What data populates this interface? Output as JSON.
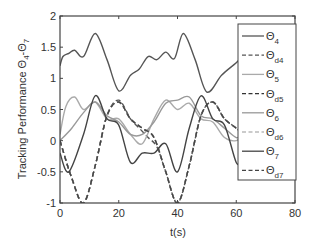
{
  "chart_data": {
    "type": "line",
    "title": "",
    "xlabel": "t(s)",
    "ylabel": "Tracking Performance Θ4-Θ7",
    "xlim": [
      0,
      80
    ],
    "ylim": [
      -1,
      2
    ],
    "xticks": [
      0,
      20,
      40,
      60,
      80
    ],
    "yticks": [
      -1,
      -0.5,
      0,
      0.5,
      1,
      1.5,
      2
    ],
    "xtick_labels": [
      "0",
      "20",
      "40",
      "60",
      "80"
    ],
    "ytick_labels": [
      "-1",
      "-0.5",
      "0",
      "0.5",
      "1",
      "1.5",
      "2"
    ],
    "grid": false,
    "legend_position": "right-inside",
    "series": [
      {
        "name": "Θ4",
        "style": "solid",
        "color": "#555555",
        "x": [
          0,
          1,
          3,
          5,
          8,
          12,
          16,
          20,
          24,
          27,
          30,
          33,
          36,
          39,
          42,
          46,
          50,
          55,
          60,
          62
        ],
        "values": [
          1.2,
          1.35,
          1.4,
          1.45,
          1.35,
          1.72,
          1.3,
          0.8,
          1.05,
          1.15,
          1.35,
          1.3,
          1.42,
          1.32,
          1.72,
          1.3,
          0.78,
          1.05,
          1.25,
          1.35
        ]
      },
      {
        "name": "Θd4",
        "style": "dashed",
        "color": "#555555",
        "x": [
          0,
          4,
          8,
          12,
          16,
          20,
          24,
          27,
          30,
          33,
          36,
          40,
          44,
          48,
          52,
          56,
          60,
          62
        ],
        "values": [
          0.0,
          -0.6,
          -1.0,
          -0.4,
          0.4,
          0.65,
          0.35,
          0.2,
          0.05,
          -0.1,
          -0.5,
          -1.0,
          -0.4,
          0.4,
          0.62,
          0.35,
          0.2,
          0.1
        ]
      },
      {
        "name": "Θ5",
        "style": "solid",
        "color": "#aaaaaa",
        "x": [
          0,
          2,
          5,
          8,
          12,
          16,
          20,
          24,
          28,
          32,
          36,
          40,
          44,
          48,
          52,
          56,
          60,
          62
        ],
        "values": [
          0.1,
          0.55,
          0.7,
          0.5,
          0.62,
          0.35,
          0.35,
          0.1,
          -0.05,
          0.35,
          0.65,
          0.5,
          0.6,
          0.35,
          0.3,
          0.05,
          0.0,
          0.1
        ]
      },
      {
        "name": "Θd5",
        "style": "dashed",
        "color": "#333333",
        "x": [
          0,
          4,
          8,
          12,
          16,
          20,
          24,
          28,
          32,
          36,
          40,
          44,
          48,
          52,
          56,
          60,
          62
        ],
        "values": [
          0.0,
          -0.6,
          -1.0,
          -0.4,
          0.4,
          0.62,
          0.35,
          0.2,
          0.05,
          -0.5,
          -1.0,
          -0.4,
          0.4,
          0.62,
          0.35,
          0.2,
          0.1
        ]
      },
      {
        "name": "Θ6",
        "style": "solid",
        "color": "#999999",
        "x": [
          0,
          4,
          8,
          12,
          16,
          20,
          24,
          28,
          32,
          36,
          40,
          44,
          48,
          52,
          56,
          60,
          62
        ],
        "values": [
          0.0,
          0.2,
          0.45,
          0.62,
          0.4,
          0.3,
          0.1,
          0.1,
          0.3,
          0.6,
          0.65,
          0.7,
          0.4,
          0.35,
          0.2,
          0.05,
          0.1
        ]
      },
      {
        "name": "Θd6",
        "style": "dashed",
        "color": "#bbbbbb",
        "x": [
          0,
          4,
          8,
          12,
          16,
          20,
          24,
          28,
          32,
          36,
          40,
          44,
          48,
          52,
          56,
          60,
          62
        ],
        "values": [
          0.0,
          -0.6,
          -1.0,
          -0.4,
          0.4,
          0.62,
          0.35,
          0.2,
          0.05,
          -0.5,
          -1.0,
          -0.4,
          0.4,
          0.62,
          0.35,
          0.2,
          0.1
        ]
      },
      {
        "name": "Θ7",
        "style": "solid",
        "color": "#444444",
        "x": [
          0,
          3,
          8,
          12,
          16,
          20,
          24,
          28,
          32,
          36,
          40,
          44,
          48,
          52,
          56,
          60,
          62
        ],
        "values": [
          -0.2,
          -0.5,
          0.1,
          0.72,
          0.35,
          0.25,
          -0.35,
          -0.2,
          -0.2,
          -0.05,
          -0.5,
          0.2,
          0.72,
          0.35,
          0.25,
          -0.35,
          -0.3
        ]
      },
      {
        "name": "Θd7",
        "style": "dashed",
        "color": "#444444",
        "x": [
          0,
          4,
          8,
          12,
          16,
          20,
          24,
          28,
          32,
          36,
          40,
          44,
          48,
          52,
          56,
          60,
          62
        ],
        "values": [
          0.0,
          -0.6,
          -1.0,
          -0.4,
          0.4,
          0.62,
          0.35,
          0.2,
          0.05,
          -0.5,
          -1.0,
          -0.4,
          0.4,
          0.62,
          0.35,
          0.2,
          0.1
        ]
      }
    ],
    "legend": [
      {
        "label": "Θ",
        "sub": "4",
        "style": "solid",
        "color": "#555555"
      },
      {
        "label": "Θ",
        "sub": "d4",
        "style": "dashed",
        "color": "#555555"
      },
      {
        "label": "Θ",
        "sub": "5",
        "style": "solid",
        "color": "#aaaaaa"
      },
      {
        "label": "Θ",
        "sub": "d5",
        "style": "dashed",
        "color": "#333333"
      },
      {
        "label": "Θ",
        "sub": "6",
        "style": "solid",
        "color": "#999999"
      },
      {
        "label": "Θ",
        "sub": "d6",
        "style": "dashed",
        "color": "#bbbbbb"
      },
      {
        "label": "Θ",
        "sub": "7",
        "style": "solid",
        "color": "#444444"
      },
      {
        "label": "Θ",
        "sub": "d7",
        "style": "dashed",
        "color": "#444444"
      }
    ]
  }
}
